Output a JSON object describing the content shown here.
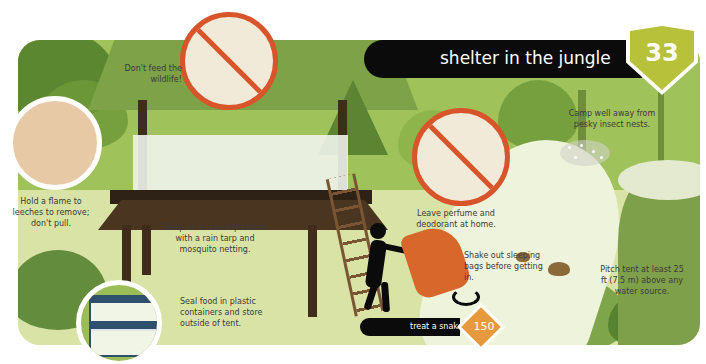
{
  "header": {
    "title": "shelter in the jungle",
    "page_number": "33",
    "badge_color": "#b7c23a",
    "banner_color": "#0b0b0b"
  },
  "tips": [
    {
      "id": "wildlife",
      "text": "Don't feed the wildlife!",
      "icon": "no-feeding-monkey-icon"
    },
    {
      "id": "leeches",
      "text": "Hold a flame to leeches to remove; don't pull.",
      "icon": "leech-flame-icon"
    },
    {
      "id": "platform",
      "text": "Sleep on a raised platform with a rain tarp and mosquito netting.",
      "icon": "raised-platform-shelter"
    },
    {
      "id": "food",
      "text": "Seal food in plastic containers and store outside of tent.",
      "icon": "food-containers-icon"
    },
    {
      "id": "perfume",
      "text": "Leave perfume and deodorant at home.",
      "icon": "no-perfume-icon"
    },
    {
      "id": "sleeping_bags",
      "text": "Shake out sleeping bags before getting in.",
      "icon": "person-shaking-sleeping-bag"
    },
    {
      "id": "insects",
      "text": "Camp well away from pesky insect nests.",
      "icon": "insect-nest-icon"
    },
    {
      "id": "water",
      "text": "Pitch tent at least 25 ft (7.5 m) above any water source.",
      "icon": "river-cliff"
    }
  ],
  "cross_reference": {
    "label": "treat a snake bite",
    "page": "150",
    "diamond_color": "#e79a3d"
  },
  "colors": {
    "prohibition_red": "#d8542a",
    "jungle_green": "#9fc25a",
    "ground": "#d9e3a6"
  }
}
